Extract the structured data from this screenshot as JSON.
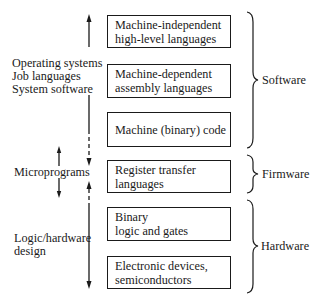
{
  "figure": {
    "boxes": [
      {
        "line1": "Machine-independent",
        "line2": "high-level languages"
      },
      {
        "line1": "Machine-dependent",
        "line2": "assembly languages"
      },
      {
        "line1": "Machine (binary) code",
        "line2": ""
      },
      {
        "line1": "Register transfer",
        "line2": "languages"
      },
      {
        "line1": "Binary",
        "line2": "logic and gates"
      },
      {
        "line1": "Electronic devices,",
        "line2": "semiconductors"
      }
    ],
    "left_labels": {
      "system": [
        "Operating systems",
        "Job languages",
        "System software"
      ],
      "micro": "Microprograms",
      "logic": [
        "Logic/hardware",
        "design"
      ]
    },
    "right_labels": {
      "software": "Software",
      "firmware": "Firmware",
      "hardware": "Hardware"
    }
  }
}
